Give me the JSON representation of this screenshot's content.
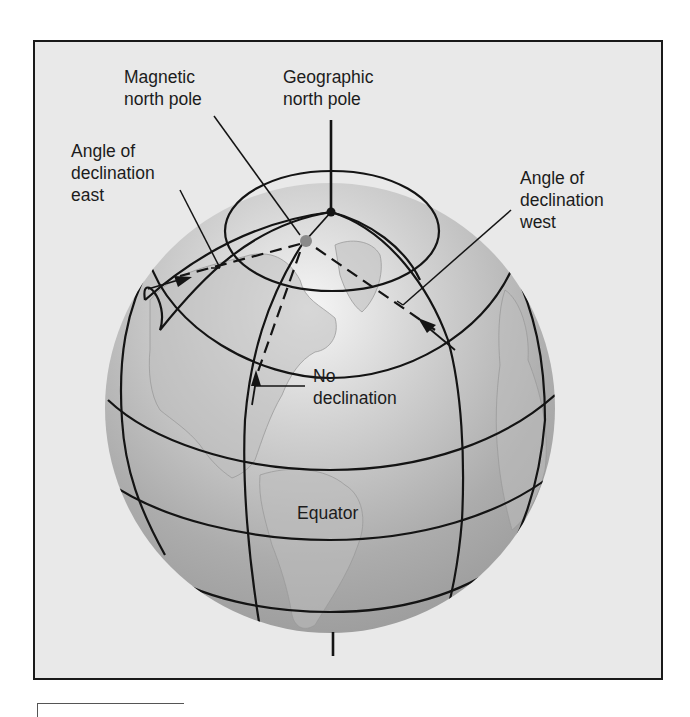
{
  "figure": {
    "labels": {
      "magnetic_north_pole": "Magnetic\nnorth pole",
      "geographic_north_pole": "Geographic\nnorth pole",
      "angle_declination_east": "Angle of\ndeclination\neast",
      "angle_declination_west": "Angle of\ndeclination\nwest",
      "no_declination": "No\ndeclination",
      "equator": "Equator"
    },
    "colors": {
      "frame_background": "#e9e9e9",
      "globe_highlight": "#f4f4f4",
      "globe_shadow": "#9a9a9a",
      "land": "#c4c4c4",
      "lines": "#141414",
      "magnetic_pole_dot": "#8a8a8a"
    }
  }
}
